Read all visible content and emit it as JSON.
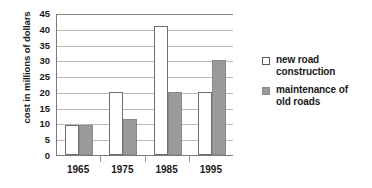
{
  "chart_data": {
    "type": "bar",
    "title": "",
    "xlabel": "",
    "ylabel": "cost in millions of dollars",
    "categories": [
      "1965",
      "1975",
      "1985",
      "1995"
    ],
    "series": [
      {
        "name": "new road construction",
        "values": [
          9.5,
          20,
          41,
          20
        ],
        "color": "#ffffff"
      },
      {
        "name": "maintenance of old roads",
        "values": [
          9.5,
          11.5,
          20,
          30
        ],
        "color": "#9a9a9a"
      }
    ],
    "ylim": [
      0,
      45
    ],
    "ytick_step": 5,
    "yticks": [
      0,
      5,
      10,
      15,
      20,
      25,
      30,
      35,
      40,
      45
    ],
    "ytick_labels": [
      "0",
      "5",
      "10",
      "15",
      "20",
      "25",
      "30",
      "35",
      "40",
      "45"
    ],
    "grid": true,
    "grid_axis": "y",
    "legend_position": "right",
    "legend": [
      {
        "label_line1": "new road",
        "label_line2": "construction"
      },
      {
        "label_line1": "maintenance of",
        "label_line2": "old roads"
      }
    ]
  },
  "colors": {
    "grid": "#b9b9b9",
    "axis": "#7a7a7a",
    "text": "#1a1a1a",
    "bar_new": "#ffffff",
    "bar_maintenance": "#9a9a9a",
    "background": "#ffffff"
  }
}
